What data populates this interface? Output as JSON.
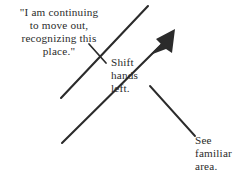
{
  "diagram": {
    "background_color": "#ffffff",
    "ink_color": "#2b2b2b",
    "width": 246,
    "height": 187,
    "annotations": {
      "quote": "\"I am continuing\nto move out,\nrecognizing this\nplace.\"",
      "shift_hands": "Shift\nhands\nleft.",
      "see_familiar": "See\nfamiliar\narea."
    },
    "strokes": {
      "quote_leader_line": "leader-line-from-quote",
      "path_line": "long-diagonal-path-line",
      "movement_arrow": "up-right-movement-arrow",
      "familiar_area_leader_line": "leader-line-to-familiar-area"
    }
  }
}
